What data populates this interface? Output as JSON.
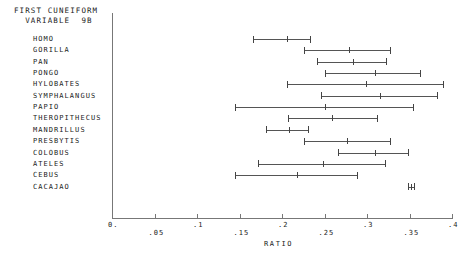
{
  "chart_data": {
    "type": "bar",
    "title": "FIRST CUNEIFORM\n  VARIABLE  9B",
    "title_line1": "FIRST CUNEIFORM",
    "title_line2": "  VARIABLE  9B",
    "xlabel": "RATIO",
    "ylabel": "",
    "orientation": "horizontal",
    "plot_style": "range-interval (min / center / max per taxon)",
    "xlim": [
      0.0,
      0.4
    ],
    "xticks": [
      0.0,
      0.05,
      0.1,
      0.15,
      0.2,
      0.25,
      0.3,
      0.35,
      0.4
    ],
    "xticklabels": [
      "0.",
      ".05",
      ".1",
      ".15",
      ".2",
      ".25",
      ".3",
      ".35",
      ".4"
    ],
    "grid": false,
    "legend": "none",
    "categories": [
      "HOMO",
      "GORILLA",
      "PAN",
      "PONGO",
      "HYLOBATES",
      "SYMPHALANGUS",
      "PAPIO",
      "THEROPITHECUS",
      "MANDRILLUS",
      "PRESBYTIS",
      "COLOBUS",
      "ATELES",
      "CEBUS",
      "CACAJAO"
    ],
    "series": [
      {
        "name": "minimum",
        "values": [
          0.166,
          0.226,
          0.241,
          0.251,
          0.206,
          0.246,
          0.145,
          0.207,
          0.181,
          0.226,
          0.266,
          0.172,
          0.145,
          0.348
        ]
      },
      {
        "name": "mean",
        "values": [
          0.206,
          0.279,
          0.284,
          0.309,
          0.299,
          0.315,
          0.251,
          0.259,
          0.208,
          0.276,
          0.309,
          0.248,
          0.218,
          0.352
        ]
      },
      {
        "name": "maximum",
        "values": [
          0.233,
          0.327,
          0.322,
          0.362,
          0.389,
          0.382,
          0.354,
          0.312,
          0.231,
          0.327,
          0.348,
          0.321,
          0.288,
          0.355
        ]
      }
    ]
  }
}
